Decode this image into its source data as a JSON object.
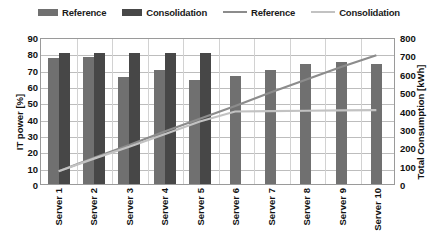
{
  "chart_data": {
    "type": "bar",
    "title": "",
    "xlabel": "",
    "ylabel": "IT power [%]",
    "y2label": "Total Consumption [kWh]",
    "categories": [
      "Server 1",
      "Server 2",
      "Server 3",
      "Server 4",
      "Server 5",
      "Server 6",
      "Server 7",
      "Server 8",
      "Server 9",
      "Server 10"
    ],
    "ylim": [
      0,
      90
    ],
    "y2lim": [
      0,
      800
    ],
    "yticks": [
      0,
      10,
      20,
      30,
      40,
      50,
      60,
      70,
      80,
      90
    ],
    "y2ticks": [
      0,
      100,
      200,
      300,
      400,
      500,
      600,
      700,
      800
    ],
    "grid": true,
    "legend_position": "top",
    "series": [
      {
        "name": "Reference",
        "kind": "bar",
        "axis": "left",
        "color": "#707070",
        "values": [
          77,
          78,
          65.5,
          69.5,
          63.5,
          66,
          69.5,
          73.5,
          74.5,
          73.5
        ]
      },
      {
        "name": "Consolidation",
        "kind": "bar",
        "axis": "left",
        "color": "#474747",
        "values": [
          80,
          80,
          80.5,
          80.5,
          80.5,
          null,
          null,
          null,
          null,
          null
        ]
      },
      {
        "name": "Reference",
        "kind": "line",
        "axis": "right",
        "color": "#8c8c8c",
        "values": [
          70,
          145,
          215,
          290,
          360,
          430,
          505,
          575,
          645,
          710
        ]
      },
      {
        "name": "Consolidation",
        "kind": "line",
        "axis": "right",
        "color": "#c2c2c2",
        "values": [
          70,
          140,
          205,
          275,
          345,
          400,
          402,
          404,
          406,
          408
        ]
      }
    ]
  },
  "legend": {
    "items": [
      {
        "label": "Reference",
        "type": "bar",
        "color": "#707070"
      },
      {
        "label": "Consolidation",
        "type": "bar",
        "color": "#474747"
      },
      {
        "label": "Reference",
        "type": "line",
        "color": "#8c8c8c"
      },
      {
        "label": "Consolidation",
        "type": "line",
        "color": "#c2c2c2"
      }
    ]
  },
  "axes": {
    "left_title": "IT power [%]",
    "right_title": "Total Consumption [kWh]",
    "left_ticks": [
      "90",
      "80",
      "70",
      "60",
      "50",
      "40",
      "30",
      "20",
      "10",
      "0"
    ],
    "right_ticks": [
      "800",
      "700",
      "600",
      "500",
      "400",
      "300",
      "200",
      "100",
      "0"
    ]
  }
}
